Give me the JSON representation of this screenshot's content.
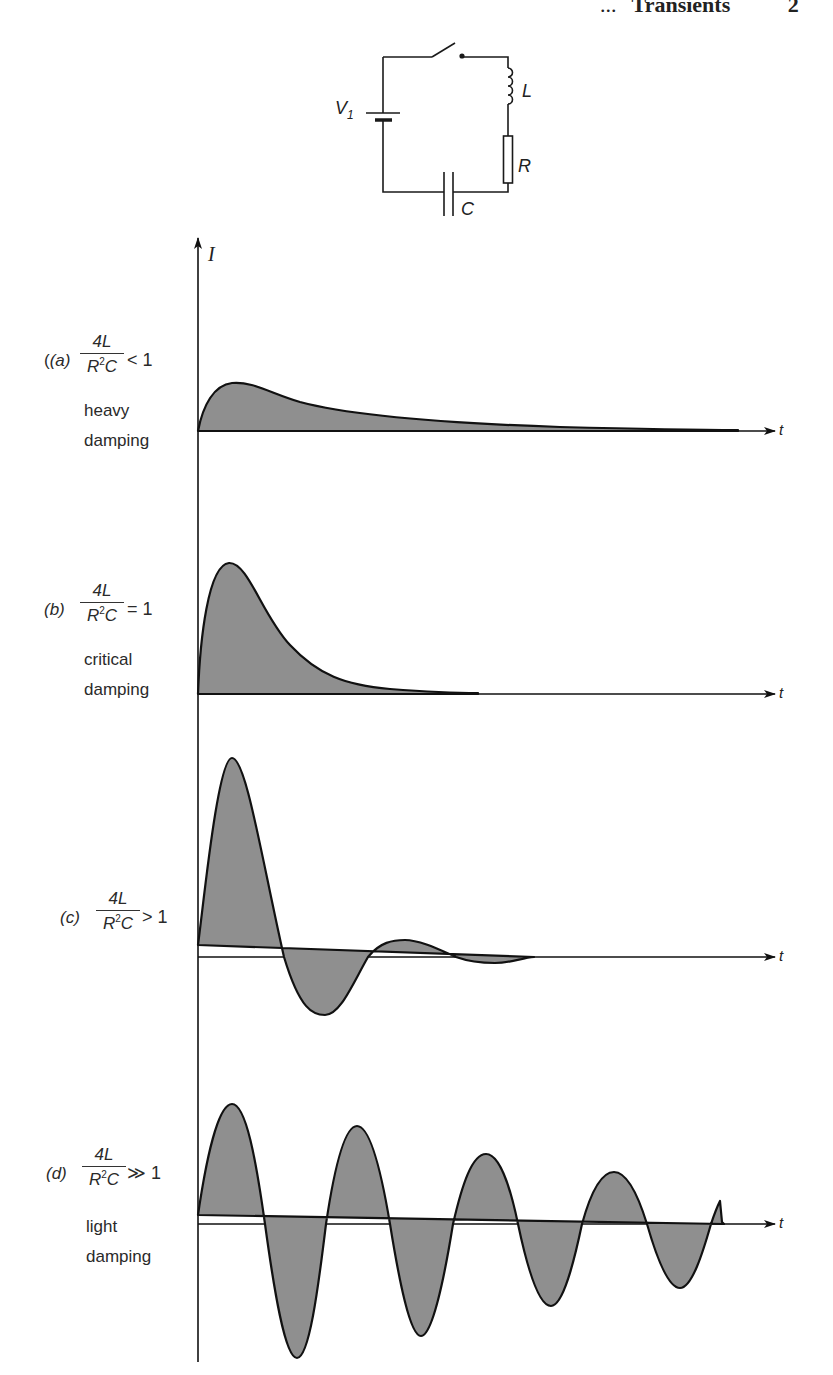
{
  "page_header": {
    "leading": "...",
    "title": "Transients",
    "page_number": "2"
  },
  "circuit": {
    "components": [
      "switch",
      "battery",
      "inductor",
      "resistor",
      "capacitor"
    ],
    "labels": {
      "voltage": "V",
      "voltage_sub": "1",
      "inductor": "L",
      "resistor": "R",
      "capacitor": "C"
    }
  },
  "axes": {
    "y_label": "I",
    "x_label": "t"
  },
  "cases": [
    {
      "id": "(a)",
      "numerator": "4L",
      "denominator": "R",
      "denominator_sup": "2",
      "denominator_tail": "C",
      "relation": "< 1",
      "caption_lines": [
        "heavy",
        "damping"
      ]
    },
    {
      "id": "(b)",
      "numerator": "4L",
      "denominator": "R",
      "denominator_sup": "2",
      "denominator_tail": "C",
      "relation": "= 1",
      "caption_lines": [
        "critical",
        "damping"
      ]
    },
    {
      "id": "(c)",
      "numerator": "4L",
      "denominator": "R",
      "denominator_sup": "2",
      "denominator_tail": "C",
      "relation": "> 1",
      "caption_lines": []
    },
    {
      "id": "(d)",
      "numerator": "4L",
      "denominator": "R",
      "denominator_sup": "2",
      "denominator_tail": "C",
      "relation": "≫ 1",
      "caption_lines": [
        "light",
        "damping"
      ]
    }
  ],
  "colors": {
    "ink": "#111111",
    "fill": "#8f8f8f",
    "background": "#ffffff"
  }
}
